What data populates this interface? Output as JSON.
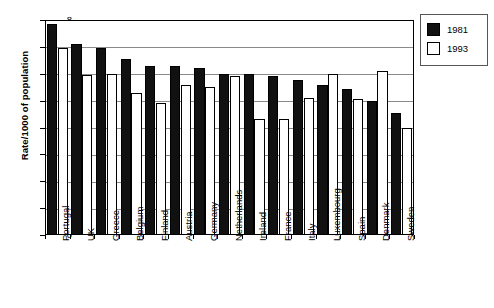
{
  "chart_data": {
    "type": "bar",
    "title": "",
    "subtitle": "",
    "xlabel": "",
    "ylabel": "Rate/1000 of population",
    "ylim": [
      0,
      8
    ],
    "ytick_step": 1,
    "yticks": [
      "8",
      "7",
      "6",
      "5",
      "4",
      "3",
      "2",
      "1",
      "0"
    ],
    "grid": true,
    "legend_position": "top-right",
    "categories": [
      "Portugal",
      "UK",
      "Greece",
      "Belgium",
      "Finland",
      "Austria",
      "Germany",
      "Netherlands",
      "Ireland",
      "France",
      "Italy",
      "Luxembourg",
      "Spain",
      "Denmark",
      "Sweden"
    ],
    "series": [
      {
        "name": "1981",
        "color": "#111111",
        "values": [
          7.85,
          7.1,
          6.95,
          6.55,
          6.3,
          6.3,
          6.2,
          6.0,
          6.0,
          5.9,
          5.75,
          5.6,
          5.45,
          5.0,
          4.55
        ]
      },
      {
        "name": "1993",
        "color": "#ffffff",
        "values": [
          6.95,
          5.95,
          6.0,
          5.3,
          4.9,
          5.6,
          5.5,
          5.9,
          4.3,
          4.3,
          5.1,
          6.0,
          5.05,
          6.1,
          4.0
        ]
      }
    ]
  },
  "legend": {
    "items": [
      {
        "label": "1981",
        "style": "filled"
      },
      {
        "label": "1993",
        "style": "outlined"
      }
    ]
  }
}
